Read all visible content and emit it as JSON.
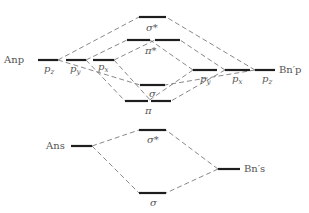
{
  "diagram": {
    "title": "",
    "atoms": {
      "A_np": "Anp",
      "B_np": "Bn′p",
      "A_ns": "Ans",
      "B_ns": "Bn′s"
    },
    "atomic_orbitals": {
      "A_pz": "p",
      "A_pz_sub": "z",
      "A_py": "p",
      "A_py_sub": "y",
      "A_px": "p",
      "A_px_sub": "x",
      "B_py": "p",
      "B_py_sub": "y",
      "B_px": "p",
      "B_px_sub": "x",
      "B_pz": "p",
      "B_pz_sub": "z"
    },
    "molecular_orbitals": {
      "sigma_star_p": "σ*",
      "pi_star": "π*",
      "sigma_p": "σ",
      "pi": "π",
      "sigma_star_s": "σ*",
      "sigma_s": "σ"
    },
    "colors": {
      "level": "#1e1e1e",
      "connector": "#6a6a6a",
      "label": "#555555"
    }
  }
}
